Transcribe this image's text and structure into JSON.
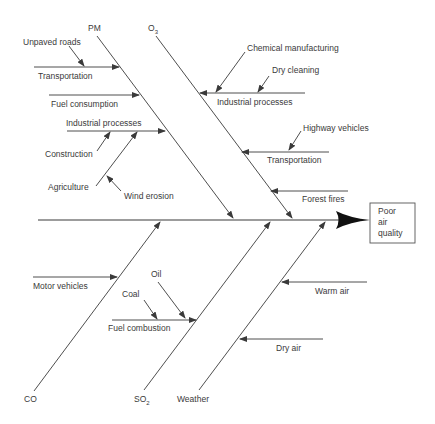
{
  "diagram": {
    "type": "fishbone (cause-and-effect / Ishikawa)",
    "effect": {
      "line1": "Poor",
      "line2": "air",
      "line3": "quality"
    },
    "categories": {
      "pm": {
        "label": "PM",
        "causes": [
          {
            "label": "Transportation",
            "sub_causes": [
              "Unpaved roads"
            ]
          },
          {
            "label": "Fuel consumption",
            "sub_causes": []
          },
          {
            "label": "Industrial processes",
            "sub_causes": [
              "Construction",
              "Agriculture",
              "Wind erosion"
            ]
          }
        ]
      },
      "o3": {
        "label_main": "O",
        "label_sub": "3",
        "causes": [
          {
            "label": "Industrial processes",
            "sub_causes": [
              "Chemical manufacturing",
              "Dry cleaning"
            ]
          },
          {
            "label": "Transportation",
            "sub_causes": [
              "Highway vehicles"
            ]
          },
          {
            "label": "Forest fires",
            "sub_causes": []
          }
        ]
      },
      "co": {
        "label": "CO",
        "causes": [
          {
            "label": "Motor vehicles",
            "sub_causes": []
          }
        ]
      },
      "so2": {
        "label_main": "SO",
        "label_sub": "2",
        "causes": [
          {
            "label": "Fuel combustion",
            "sub_causes": [
              "Coal",
              "Oil"
            ]
          }
        ]
      },
      "weather": {
        "label": "Weather",
        "causes": [
          {
            "label": "Warm air",
            "sub_causes": []
          },
          {
            "label": "Dry air",
            "sub_causes": []
          }
        ]
      }
    }
  },
  "labels": {
    "pm": "PM",
    "o3_main": "O",
    "o3_sub": "3",
    "co": "CO",
    "so2_main": "SO",
    "so2_sub": "2",
    "weather": "Weather",
    "unpaved_roads": "Unpaved roads",
    "pm_transportation": "Transportation",
    "fuel_consumption": "Fuel consumption",
    "pm_industrial_processes": "Industrial processes",
    "construction": "Construction",
    "agriculture": "Agriculture",
    "wind_erosion": "Wind erosion",
    "chemical_manufacturing": "Chemical manufacturing",
    "dry_cleaning": "Dry cleaning",
    "o3_industrial_processes": "Industrial processes",
    "highway_vehicles": "Highway vehicles",
    "o3_transportation": "Transportation",
    "forest_fires": "Forest fires",
    "motor_vehicles": "Motor vehicles",
    "coal": "Coal",
    "oil": "Oil",
    "fuel_combustion": "Fuel combustion",
    "warm_air": "Warm air",
    "dry_air": "Dry air",
    "effect_line1": "Poor",
    "effect_line2": "air",
    "effect_line3": "quality"
  },
  "colors": {
    "line": "#3a3a3a",
    "text": "#3a3a3a",
    "background": "#ffffff"
  }
}
